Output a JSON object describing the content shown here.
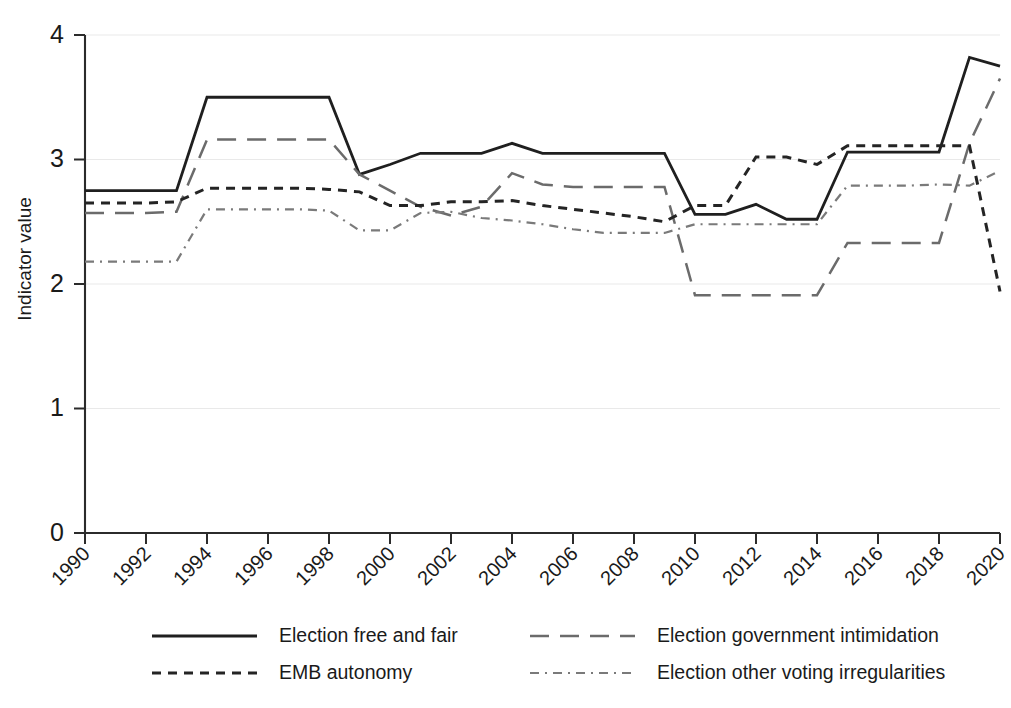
{
  "chart_data": {
    "type": "line",
    "title": "",
    "xlabel": "",
    "ylabel": "Indicator value",
    "xlim": [
      1990,
      2020
    ],
    "ylim": [
      0,
      4
    ],
    "ytick_labels": [
      "0",
      "1",
      "2",
      "3",
      "4"
    ],
    "ytick_values": [
      0,
      1,
      2,
      3,
      4
    ],
    "xtick_labels": [
      "1990",
      "1992",
      "1994",
      "1996",
      "1998",
      "2000",
      "2002",
      "2004",
      "2006",
      "2008",
      "2010",
      "2012",
      "2014",
      "2016",
      "2018",
      "2020"
    ],
    "xtick_values": [
      1990,
      1992,
      1994,
      1996,
      1998,
      2000,
      2002,
      2004,
      2006,
      2008,
      2010,
      2012,
      2014,
      2016,
      2018,
      2020
    ],
    "grid": "horizontal",
    "legend_position": "bottom",
    "x": [
      1990,
      1991,
      1992,
      1993,
      1994,
      1995,
      1996,
      1997,
      1998,
      1999,
      2000,
      2001,
      2002,
      2003,
      2004,
      2005,
      2006,
      2007,
      2008,
      2009,
      2010,
      2011,
      2012,
      2013,
      2014,
      2015,
      2016,
      2017,
      2018,
      2019,
      2020
    ],
    "series": [
      {
        "name": "Election free and fair",
        "style": "solid",
        "color": "#1f1f1f",
        "values": [
          2.75,
          2.75,
          2.75,
          2.75,
          3.5,
          3.5,
          3.5,
          3.5,
          3.5,
          2.88,
          2.96,
          3.05,
          3.05,
          3.05,
          3.13,
          3.05,
          3.05,
          3.05,
          3.05,
          3.05,
          2.56,
          2.56,
          2.64,
          2.52,
          2.52,
          3.06,
          3.06,
          3.06,
          3.06,
          3.82,
          3.75
        ]
      },
      {
        "name": "Election government intimidation",
        "style": "long-dash",
        "color": "#6b6b6b",
        "values": [
          2.57,
          2.57,
          2.57,
          2.58,
          3.16,
          3.16,
          3.16,
          3.16,
          3.16,
          2.88,
          2.75,
          2.62,
          2.55,
          2.62,
          2.89,
          2.8,
          2.78,
          2.78,
          2.78,
          2.78,
          1.91,
          1.91,
          1.91,
          1.91,
          1.91,
          2.33,
          2.33,
          2.33,
          2.33,
          3.13,
          3.65
        ]
      },
      {
        "name": "EMB autonomy",
        "style": "short-dash",
        "color": "#242424",
        "values": [
          2.65,
          2.65,
          2.65,
          2.66,
          2.77,
          2.77,
          2.77,
          2.77,
          2.76,
          2.74,
          2.63,
          2.63,
          2.66,
          2.66,
          2.67,
          2.63,
          2.6,
          2.57,
          2.54,
          2.5,
          2.63,
          2.63,
          3.02,
          3.02,
          2.96,
          3.11,
          3.11,
          3.11,
          3.11,
          3.11,
          1.94
        ]
      },
      {
        "name": "Election other voting irregularities",
        "style": "dash-dot",
        "color": "#7a7a7a",
        "values": [
          2.18,
          2.18,
          2.18,
          2.18,
          2.6,
          2.6,
          2.6,
          2.6,
          2.59,
          2.43,
          2.43,
          2.57,
          2.58,
          2.53,
          2.51,
          2.48,
          2.44,
          2.41,
          2.41,
          2.41,
          2.48,
          2.48,
          2.48,
          2.48,
          2.48,
          2.79,
          2.79,
          2.79,
          2.8,
          2.79,
          2.91
        ]
      }
    ]
  },
  "legend": {
    "items": [
      {
        "label": "Election free and fair",
        "style": "solid"
      },
      {
        "label": "Election government intimidation",
        "style": "long-dash"
      },
      {
        "label": "EMB autonomy",
        "style": "short-dash"
      },
      {
        "label": "Election other voting irregularities",
        "style": "dash-dot"
      }
    ]
  }
}
